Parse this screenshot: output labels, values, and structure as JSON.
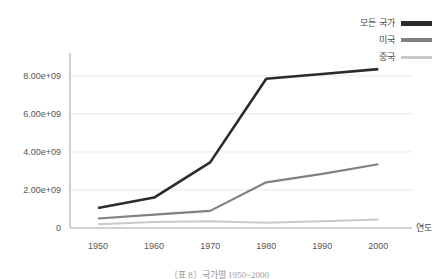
{
  "chart_data": {
    "type": "line",
    "title": "",
    "xlabel": "연도",
    "ylabel": "",
    "x": [
      1950,
      1960,
      1970,
      1980,
      1990,
      2000
    ],
    "xtick_labels": [
      "1950",
      "1960",
      "1970",
      "1980",
      "1990",
      "2000"
    ],
    "ytick_labels": [
      "0",
      "2.00e+09",
      "4.00e+09",
      "6.00e+09",
      "8.00e+09"
    ],
    "ytick_values": [
      0,
      2000000000,
      4000000000,
      6000000000,
      8000000000
    ],
    "ylim": [
      0,
      9200000000
    ],
    "xlim": [
      1945,
      2006
    ],
    "grid": "horizontal",
    "legend_position": "top-right",
    "series": [
      {
        "name": "모든 국가",
        "color": "#2b2b2b",
        "width": 2.6,
        "values": [
          1050000000,
          1600000000,
          3450000000,
          7850000000,
          8100000000,
          8350000000
        ]
      },
      {
        "name": "미국",
        "color": "#808080",
        "width": 2.2,
        "values": [
          500000000,
          700000000,
          900000000,
          2400000000,
          2850000000,
          3350000000
        ]
      },
      {
        "name": "중국",
        "color": "#c9c9c9",
        "width": 2.0,
        "values": [
          200000000,
          320000000,
          350000000,
          280000000,
          350000000,
          450000000
        ]
      }
    ]
  },
  "legend": {
    "items": [
      {
        "label": "모든 국가"
      },
      {
        "label": "미국"
      },
      {
        "label": "중국"
      }
    ]
  },
  "axes": {
    "x_title": "연도"
  },
  "caption": {
    "text": "〔표 8〕국가별 1950~2000"
  }
}
